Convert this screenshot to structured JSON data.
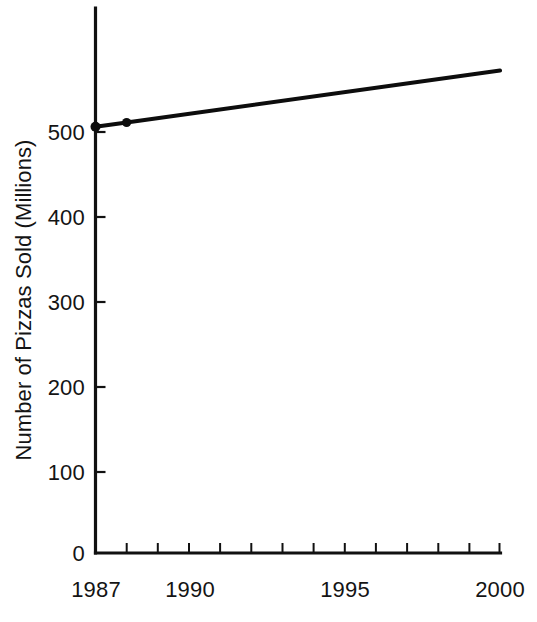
{
  "chart_data": {
    "type": "line",
    "title": "",
    "subtitle": "",
    "xlabel": "",
    "ylabel": "Number of Pizzas Sold (Millions)",
    "x": [
      1987,
      1988,
      2000
    ],
    "values": [
      500,
      505,
      566
    ],
    "series": [
      {
        "name": "Pizzas Sold",
        "x": [
          1987,
          1988,
          2000
        ],
        "values": [
          500,
          505,
          566
        ],
        "marked_points": [
          {
            "x": 1987,
            "y": 500
          },
          {
            "x": 1988,
            "y": 505
          }
        ]
      }
    ],
    "xlim": [
      1987,
      2000
    ],
    "ylim": [
      0,
      600
    ],
    "x_tick_labels": [
      "1987",
      "1990",
      "1995",
      "2000"
    ],
    "x_tick_values": [
      1987,
      1990,
      1995,
      2000
    ],
    "x_minor_tick_values": [
      1988,
      1989,
      1991,
      1992,
      1993,
      1994,
      1996,
      1997,
      1998,
      1999
    ],
    "y_tick_labels": [
      "0",
      "100",
      "200",
      "300",
      "400",
      "500"
    ],
    "y_tick_values": [
      0,
      100,
      200,
      300,
      400,
      500
    ],
    "grid": false,
    "legend": false,
    "legend_position": "none",
    "line_color": "#0d0d0d",
    "axis_color": "#111111",
    "background_color": "#ffffff",
    "annotations": []
  },
  "axis": {
    "y_title": "Number of Pizzas Sold (Millions)"
  },
  "y_ticks": [
    {
      "label": "500",
      "value": 500
    },
    {
      "label": "400",
      "value": 400
    },
    {
      "label": "300",
      "value": 300
    },
    {
      "label": "200",
      "value": 200
    },
    {
      "label": "100",
      "value": 100
    },
    {
      "label": "0",
      "value": 0
    }
  ],
  "x_ticks": [
    {
      "label": "1987",
      "value": 1987
    },
    {
      "label": "1990",
      "value": 1990
    },
    {
      "label": "1995",
      "value": 1995
    },
    {
      "label": "2000",
      "value": 2000
    }
  ]
}
